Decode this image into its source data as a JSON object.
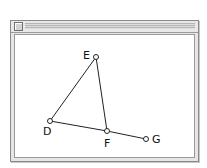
{
  "window": {
    "title": "",
    "close_box": "close-box"
  },
  "diagram": {
    "points": [
      {
        "id": "E",
        "label": "E",
        "x": 96,
        "y": 57,
        "label_x": 83,
        "label_y": 59
      },
      {
        "id": "D",
        "label": "D",
        "x": 50,
        "y": 121,
        "label_x": 43,
        "label_y": 135
      },
      {
        "id": "F",
        "label": "F",
        "x": 107,
        "y": 131,
        "label_x": 104,
        "label_y": 147
      },
      {
        "id": "G",
        "label": "G",
        "x": 146,
        "y": 139,
        "label_x": 152,
        "label_y": 143
      }
    ],
    "segments": [
      {
        "from": "D",
        "to": "E"
      },
      {
        "from": "E",
        "to": "F"
      },
      {
        "from": "D",
        "to": "F"
      },
      {
        "from": "F",
        "to": "G"
      }
    ],
    "colors": {
      "stroke": "#222222",
      "point_fill": "#ffffff"
    }
  }
}
